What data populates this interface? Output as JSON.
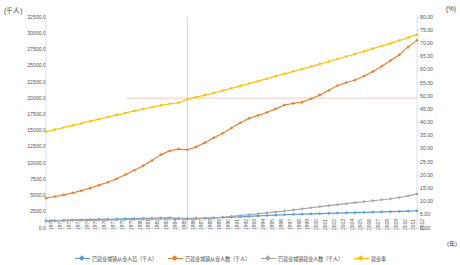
{
  "chart_data": {
    "type": "line",
    "title": "",
    "subtitle": "",
    "xlabel": "(年)",
    "ylabel": "(千人)",
    "y2label": "(%)",
    "grid": false,
    "legend_position": "bottom",
    "ylim": [
      0,
      32500
    ],
    "y2lim": [
      0,
      80
    ],
    "y_ticks": [
      "0.0",
      "2500.0",
      "5000.0",
      "7500.0",
      "10000.0",
      "12500.0",
      "15000.0",
      "17500.0",
      "20000.0",
      "22500.0",
      "25000.0",
      "27500.0",
      "30000.0",
      "32500.0"
    ],
    "y2_ticks": [
      "0.00",
      "5.00",
      "10.00",
      "15.00",
      "20.00",
      "25.00",
      "30.00",
      "35.00",
      "40.00",
      "45.00",
      "50.00",
      "55.00",
      "60.00",
      "65.00",
      "70.00",
      "75.00",
      "80.00"
    ],
    "x": [
      "1970",
      "1971",
      "1972",
      "1973",
      "1974",
      "1975",
      "1976",
      "1977",
      "1978",
      "1979",
      "1980",
      "1981",
      "1982",
      "1983",
      "1984",
      "1985",
      "1986",
      "1987",
      "1988",
      "1989",
      "1990",
      "1991",
      "1992",
      "1993",
      "1994",
      "1995",
      "1996",
      "1997",
      "1998",
      "1999",
      "2000",
      "2001",
      "2002",
      "2003",
      "2004",
      "2005",
      "2006",
      "2007",
      "2008",
      "2009",
      "2010",
      "2011",
      "2012"
    ],
    "categories": [
      "1970",
      "1971",
      "1972",
      "1973",
      "1974",
      "1975",
      "1976",
      "1977",
      "1978",
      "1979",
      "1980",
      "1981",
      "1982",
      "1983",
      "1984",
      "1985",
      "1986",
      "1987",
      "1988",
      "1989",
      "1990",
      "1991",
      "1992",
      "1993",
      "1994",
      "1995",
      "1996",
      "1997",
      "1998",
      "1999",
      "2000",
      "2001",
      "2002",
      "2003",
      "2004",
      "2005",
      "2006",
      "2007",
      "2008",
      "2009",
      "2010",
      "2011",
      "2012"
    ],
    "reference_lines": {
      "vertical_at_x": "1986",
      "horizontal_at_y": 20000,
      "color": "#e8a9a0"
    },
    "series": [
      {
        "name": "已就业城镇从业人员（千人）",
        "color": "#5b9bd5",
        "axis": "left",
        "marker": "diamond",
        "values": [
          1100,
          1140,
          1180,
          1220,
          1255,
          1290,
          1320,
          1350,
          1380,
          1410,
          1440,
          1475,
          1505,
          1535,
          1560,
          1500,
          1470,
          1490,
          1520,
          1560,
          1610,
          1660,
          1720,
          1790,
          1860,
          1930,
          1990,
          2040,
          2090,
          2130,
          2170,
          2210,
          2250,
          2290,
          2330,
          2370,
          2410,
          2450,
          2490,
          2520,
          2560,
          2600,
          2650
        ]
      },
      {
        "name": "已就业城镇从业人数（千人）",
        "color": "#ed7d31",
        "axis": "left",
        "marker": "diamond",
        "values": [
          4600,
          4850,
          5100,
          5400,
          5750,
          6150,
          6600,
          7050,
          7600,
          8250,
          8900,
          9600,
          10400,
          11300,
          11900,
          12150,
          12050,
          12500,
          13150,
          13900,
          14600,
          15400,
          16200,
          16900,
          17350,
          17800,
          18350,
          18950,
          19200,
          19400,
          19900,
          20500,
          21200,
          21950,
          22400,
          22800,
          23400,
          24100,
          24900,
          25800,
          26700,
          27900,
          28900
        ]
      },
      {
        "name": "已就业城镇就业人数（千人）",
        "color": "#a5a5a5",
        "axis": "left",
        "marker": "diamond",
        "values": [
          1080,
          1100,
          1125,
          1150,
          1175,
          1200,
          1225,
          1250,
          1280,
          1310,
          1340,
          1370,
          1400,
          1430,
          1455,
          1400,
          1380,
          1420,
          1480,
          1560,
          1660,
          1780,
          1920,
          2060,
          2200,
          2340,
          2480,
          2620,
          2780,
          2950,
          3120,
          3290,
          3450,
          3600,
          3750,
          3900,
          4050,
          4200,
          4350,
          4500,
          4700,
          4950,
          5250
        ]
      },
      {
        "name": "就业率",
        "color": "#ffc000",
        "axis": "right",
        "marker": "diamond",
        "values": [
          36.5,
          37.3,
          38.1,
          38.9,
          39.7,
          40.5,
          41.3,
          42.1,
          42.9,
          43.6,
          44.4,
          45.1,
          45.8,
          46.5,
          47.1,
          47.5,
          48.8,
          49.6,
          50.4,
          51.2,
          52.1,
          53.0,
          53.9,
          54.8,
          55.7,
          56.6,
          57.6,
          58.5,
          59.4,
          60.3,
          61.2,
          62.2,
          63.1,
          64.1,
          65.0,
          66.0,
          67.0,
          68.0,
          69.0,
          70.0,
          71.1,
          72.2,
          73.3
        ]
      }
    ]
  }
}
